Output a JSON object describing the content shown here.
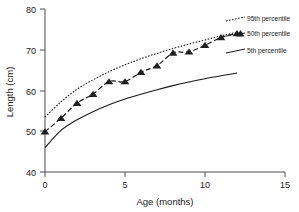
{
  "chart_data": {
    "type": "line",
    "title": "",
    "xlabel": "Age (months)",
    "ylabel": "Length (cm)",
    "xlim": [
      0,
      15
    ],
    "ylim": [
      40,
      80
    ],
    "xticks": [
      0,
      5,
      10,
      15
    ],
    "yticks": [
      40,
      50,
      60,
      70,
      80
    ],
    "xtick_labels": [
      "0",
      "5",
      "10",
      "15"
    ],
    "ytick_labels": [
      "40",
      "50",
      "60",
      "70",
      "80"
    ],
    "grid": false,
    "legend_position": "right-inside-top",
    "x": [
      0,
      1,
      2,
      3,
      4,
      5,
      6,
      7,
      8,
      9,
      10,
      11,
      12
    ],
    "series": [
      {
        "name": "5th percentile",
        "style": "solid",
        "marker": "none",
        "values": [
          46.0,
          50.2,
          52.8,
          54.8,
          56.5,
          57.9,
          59.1,
          60.2,
          61.2,
          62.1,
          62.9,
          63.6,
          64.3
        ]
      },
      {
        "name": "50th percentile",
        "style": "dashed",
        "marker": "triangle",
        "values": [
          49.9,
          53.2,
          56.9,
          59.1,
          62.2,
          62.2,
          64.5,
          66.1,
          69.2,
          69.5,
          71.1,
          73.0,
          74.0
        ]
      },
      {
        "name": "95th percentile",
        "style": "dotted",
        "marker": "none",
        "values": [
          53.5,
          57.2,
          60.3,
          62.6,
          64.6,
          66.3,
          67.8,
          69.1,
          70.3,
          71.4,
          72.4,
          73.4,
          74.3
        ]
      }
    ],
    "legend_entries": [
      {
        "label": "95th percentile"
      },
      {
        "label": "50th percentile"
      },
      {
        "label": "5th percentile"
      }
    ]
  },
  "axes": {
    "x_title": "Age (months)",
    "y_title": "Length (cm)"
  },
  "legend": {
    "p95_label": "95th percentile",
    "p50_label": "50th percentile",
    "p5_label": "5th percentile"
  },
  "ticks": {
    "x": [
      "0",
      "5",
      "10",
      "15"
    ],
    "y": [
      "40",
      "50",
      "60",
      "70",
      "80"
    ]
  }
}
